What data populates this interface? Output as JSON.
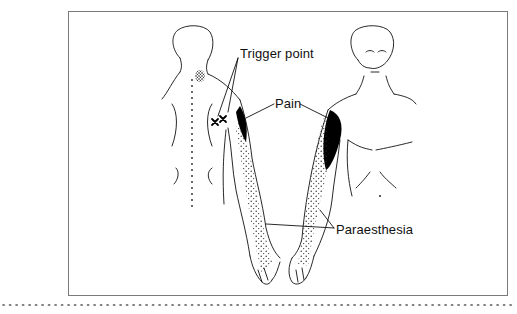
{
  "figure": {
    "labels": {
      "trigger_point": "Trigger point",
      "pain": "Pain",
      "paraesthesia": "Paraesthesia"
    },
    "views": [
      "posterior-view",
      "anterior-view"
    ],
    "markers": {
      "trigger_point_count": 2,
      "trigger_point_symbol": "×"
    },
    "colors": {
      "line": "#111111",
      "frame": "#7a7a7a",
      "pain_fill": "#000000",
      "stipple": "#222222"
    }
  }
}
